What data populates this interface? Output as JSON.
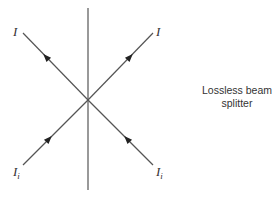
{
  "diagram": {
    "title": "Lossless beam splitter",
    "caption": {
      "line1": "Lossless beam",
      "line2": "splitter"
    },
    "splitter": {
      "orientation": "vertical",
      "x": 88,
      "y_top": 8,
      "y_bottom": 190
    },
    "center": {
      "x": 88,
      "y": 100
    },
    "beams": [
      {
        "id": "output-left",
        "label": "I",
        "subscript": "",
        "direction": "outgoing",
        "end": {
          "x": 23,
          "y": 33
        }
      },
      {
        "id": "output-right",
        "label": "I",
        "subscript": "",
        "direction": "outgoing",
        "end": {
          "x": 153,
          "y": 33
        }
      },
      {
        "id": "input-left",
        "label": "I",
        "subscript": "i",
        "direction": "incoming",
        "end": {
          "x": 23,
          "y": 165
        }
      },
      {
        "id": "input-right",
        "label": "I",
        "subscript": "i",
        "direction": "incoming",
        "end": {
          "x": 153,
          "y": 165
        }
      }
    ],
    "labels": {
      "output_left": {
        "main": "I",
        "sub": ""
      },
      "output_right": {
        "main": "I",
        "sub": ""
      },
      "input_left": {
        "main": "I",
        "sub": "i"
      },
      "input_right": {
        "main": "I",
        "sub": "i"
      }
    },
    "colors": {
      "line": "#555555",
      "arrow": "#222222",
      "text": "#333333",
      "background": "#ffffff"
    }
  }
}
